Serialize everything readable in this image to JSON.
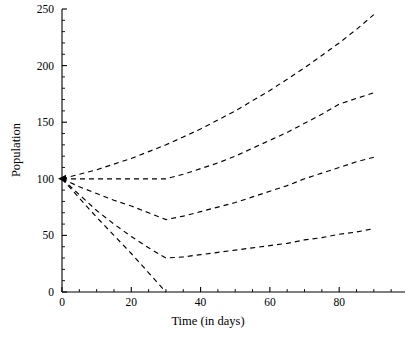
{
  "chart_data": {
    "type": "line",
    "title": "",
    "subtitle": "",
    "xlabel": "Time (in days)",
    "ylabel": "Population",
    "xlim": [
      0,
      99
    ],
    "ylim": [
      0,
      250
    ],
    "xticks": [
      0,
      20,
      40,
      60,
      80
    ],
    "xtick_labels": [
      "0",
      "20",
      "40",
      "60",
      "80"
    ],
    "xtick_minor_step": 5,
    "yticks": [
      0,
      50,
      100,
      150,
      200,
      250
    ],
    "ytick_labels": [
      "0",
      "50",
      "100",
      "150",
      "200",
      "250"
    ],
    "ytick_minor_step": 10,
    "grid": false,
    "legend": null,
    "legend_position": "none",
    "linestyle": "dashed",
    "marker_at_origin": true,
    "origin_point": [
      0,
      100
    ],
    "annotations": [],
    "series": [
      {
        "name": "curve-1",
        "x": [
          0,
          5,
          10,
          15,
          20,
          25,
          30,
          35,
          40,
          45,
          50,
          55,
          60,
          65,
          70,
          75,
          80,
          85,
          90
        ],
        "values": [
          100,
          104,
          108,
          113,
          118,
          124,
          130,
          137,
          144,
          152,
          160,
          169,
          178,
          188,
          198,
          209,
          220,
          232,
          245
        ]
      },
      {
        "name": "curve-2",
        "x": [
          0,
          5,
          10,
          15,
          20,
          25,
          30,
          35,
          40,
          45,
          50,
          55,
          60,
          65,
          70,
          75,
          80,
          85,
          90
        ],
        "values": [
          100,
          100,
          100,
          100,
          100,
          100,
          100,
          104,
          109,
          114,
          120,
          127,
          134,
          141,
          149,
          157,
          166,
          171,
          176
        ]
      },
      {
        "name": "curve-3",
        "x": [
          0,
          5,
          10,
          15,
          20,
          25,
          30,
          35,
          40,
          45,
          50,
          55,
          60,
          65,
          70,
          75,
          80,
          85,
          90
        ],
        "values": [
          100,
          93,
          87,
          81,
          76,
          70,
          64,
          67,
          71,
          75,
          79,
          84,
          89,
          94,
          100,
          105,
          110,
          115,
          119
        ]
      },
      {
        "name": "curve-4",
        "x": [
          0,
          5,
          10,
          15,
          20,
          25,
          30,
          35,
          40,
          45,
          50,
          55,
          60,
          65,
          70,
          75,
          80,
          85,
          90
        ],
        "values": [
          100,
          86,
          72,
          60,
          49,
          39,
          30,
          31,
          33,
          35,
          37,
          39,
          41,
          43,
          46,
          48,
          51,
          53,
          56
        ]
      },
      {
        "name": "curve-5",
        "x": [
          0,
          5,
          10,
          15,
          20,
          25,
          30
        ],
        "values": [
          100,
          83,
          66,
          50,
          34,
          17,
          0
        ]
      }
    ]
  }
}
